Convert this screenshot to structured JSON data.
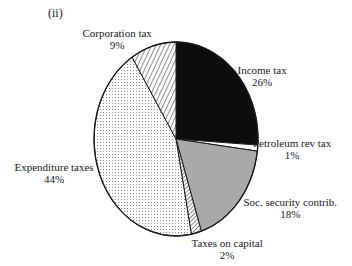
{
  "panel_label": "(ii)",
  "chart_data": {
    "type": "pie",
    "title": "",
    "start_angle_deg": 0,
    "direction": "clockwise",
    "geometry": {
      "cx": 176,
      "cy": 139,
      "rx": 82,
      "ry": 97
    },
    "slices": [
      {
        "name": "Income tax",
        "value": 26,
        "pct_label": "26%",
        "fill": "black"
      },
      {
        "name": "Petroleum rev tax",
        "value": 1,
        "pct_label": "1%",
        "fill": "white"
      },
      {
        "name": "Soc. security contrib.",
        "value": 18,
        "pct_label": "18%",
        "fill": "gray"
      },
      {
        "name": "Taxes on capital",
        "value": 2,
        "pct_label": "2%",
        "fill": "hatch-dense"
      },
      {
        "name": "Expenditure taxes",
        "value": 44,
        "pct_label": "44%",
        "fill": "dots"
      },
      {
        "name": "Corporation tax",
        "value": 9,
        "pct_label": "9%",
        "fill": "hatch"
      }
    ],
    "labels": [
      {
        "name": "Income tax",
        "pct": "26%",
        "x": 262,
        "y": 64
      },
      {
        "name": "Petroleum rev tax",
        "pct": "1%",
        "x": 292,
        "y": 137
      },
      {
        "name": "Soc. security contrib.",
        "pct": "18%",
        "x": 290,
        "y": 196
      },
      {
        "name": "Taxes on capital",
        "pct": "2%",
        "x": 227,
        "y": 237
      },
      {
        "name": "Expenditure taxes",
        "pct": "44%",
        "x": 54,
        "y": 161
      },
      {
        "name": "Corporation tax",
        "pct": "9%",
        "x": 117,
        "y": 27
      }
    ],
    "colors": {
      "black": "#0d0d0d",
      "gray": "#a9a9a9",
      "stroke": "#1a1a1a",
      "dot": "#9a9a9a",
      "white": "#ffffff"
    }
  }
}
